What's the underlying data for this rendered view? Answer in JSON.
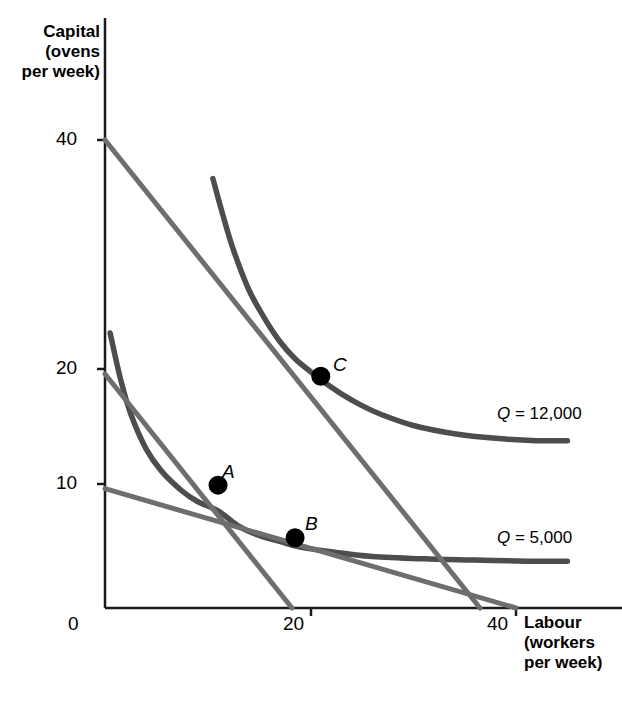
{
  "chart_data": {
    "type": "line",
    "title": "",
    "xlabel": "Labour (workers per week)",
    "ylabel": "Capital (ovens per week)",
    "xlabel_lines": [
      "Labour",
      "(workers",
      "per week)"
    ],
    "ylabel_lines": [
      "Capital",
      "(ovens",
      "per week)"
    ],
    "xlim": [
      0,
      48
    ],
    "ylim": [
      0,
      48
    ],
    "xticks": [
      "0",
      "20",
      "40"
    ],
    "xtick_values": [
      0,
      20,
      40
    ],
    "yticks": [
      "0",
      "10",
      "20",
      "40"
    ],
    "ytick_values": [
      0,
      10,
      20,
      40
    ],
    "grid": false,
    "legend": "inline-right",
    "series": [
      {
        "name": "Q = 5,000",
        "kind": "isoquant",
        "label": "Q = 5,000",
        "label_symbol": "Q",
        "label_value": "5,000",
        "color": "#4d4d4d",
        "points": [
          [
            0.5,
            23.5
          ],
          [
            1.5,
            19.6
          ],
          [
            2.5,
            16.6
          ],
          [
            4.0,
            13.6
          ],
          [
            5.5,
            11.7
          ],
          [
            7.5,
            10.0
          ],
          [
            9.0,
            9.1
          ],
          [
            11.0,
            8.3
          ],
          [
            13.0,
            7.0
          ],
          [
            15.0,
            6.2
          ],
          [
            17.0,
            5.7
          ],
          [
            19.0,
            5.2
          ],
          [
            22.0,
            4.8
          ],
          [
            26.0,
            4.4
          ],
          [
            31.0,
            4.2
          ],
          [
            36.0,
            4.1
          ],
          [
            41.0,
            4.0
          ],
          [
            45.0,
            4.0
          ]
        ]
      },
      {
        "name": "Q = 12,000",
        "kind": "isoquant",
        "label": "Q = 12,000",
        "label_symbol": "Q",
        "label_value": "12,000",
        "color": "#4d4d4d",
        "points": [
          [
            10.5,
            36.7
          ],
          [
            11.5,
            33.5
          ],
          [
            12.5,
            30.6
          ],
          [
            14.0,
            27.2
          ],
          [
            15.5,
            24.8
          ],
          [
            17.0,
            22.8
          ],
          [
            18.5,
            21.3
          ],
          [
            20.0,
            20.2
          ],
          [
            21.0,
            19.5
          ],
          [
            23.0,
            18.3
          ],
          [
            25.0,
            17.3
          ],
          [
            27.0,
            16.5
          ],
          [
            30.0,
            15.6
          ],
          [
            34.0,
            14.9
          ],
          [
            38.0,
            14.5
          ],
          [
            42.0,
            14.3
          ],
          [
            45.0,
            14.3
          ]
        ]
      },
      {
        "name": "isocost-steep-high",
        "kind": "isocost",
        "color": "#6e6e6e",
        "points": [
          [
            0,
            40.0
          ],
          [
            36.5,
            0.0
          ]
        ]
      },
      {
        "name": "isocost-steep-low",
        "kind": "isocost",
        "color": "#6e6e6e",
        "points": [
          [
            0,
            20.0
          ],
          [
            18.2,
            0.0
          ]
        ]
      },
      {
        "name": "isocost-flat",
        "kind": "isocost",
        "color": "#6e6e6e",
        "points": [
          [
            0,
            10.2
          ],
          [
            40.0,
            0.0
          ]
        ]
      }
    ],
    "points": [
      {
        "label": "A",
        "x": 11.0,
        "y": 10.5,
        "color": "#000000"
      },
      {
        "label": "B",
        "x": 18.5,
        "y": 6.0,
        "color": "#000000"
      },
      {
        "label": "C",
        "x": 21.0,
        "y": 19.8,
        "color": "#000000"
      }
    ],
    "annotations": [
      {
        "name": "point-label-A",
        "text": "A"
      },
      {
        "name": "point-label-B",
        "text": "B"
      },
      {
        "name": "point-label-C",
        "text": "C"
      }
    ]
  },
  "axis": {
    "y_title": "Capital\n(ovens\nper week)",
    "x_title": "Labour\n(workers\nper week)",
    "ticks": {
      "y40": "40",
      "y20": "20",
      "y10": "10",
      "y0": "0",
      "x20": "20",
      "x40": "40"
    }
  },
  "labels": {
    "point_a": "A",
    "point_b": "B",
    "point_c": "C",
    "q_symbol": "Q",
    "q12000_text": " = 12,000",
    "q5000_text": " = 5,000"
  }
}
